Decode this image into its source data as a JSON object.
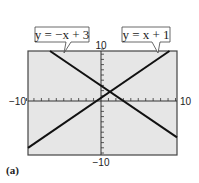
{
  "chart_data": {
    "type": "line",
    "title": "",
    "xlabel": "",
    "ylabel": "",
    "xlim": [
      -10,
      10
    ],
    "ylim": [
      -10,
      10
    ],
    "grid": false,
    "x_tick_labels": [
      "-10",
      "10"
    ],
    "y_tick_labels": [
      "10",
      "-10"
    ],
    "series": [
      {
        "name": "y = -x + 3",
        "slope": -1,
        "intercept": 3,
        "x": [
          -7,
          10
        ],
        "y": [
          10,
          -7
        ]
      },
      {
        "name": "y = x + 1",
        "slope": 1,
        "intercept": 1,
        "x": [
          -10,
          9
        ],
        "y": [
          -9,
          10
        ]
      }
    ],
    "annotations": [
      "y = −x + 3",
      "y = x + 1"
    ],
    "caption": "(a)"
  },
  "labels": {
    "line1": "y = −x + 3",
    "line2": "y = x + 1",
    "xmin": "−10",
    "xmax": "10",
    "ymax": "10",
    "ymin": "−10",
    "caption": "(a)"
  }
}
